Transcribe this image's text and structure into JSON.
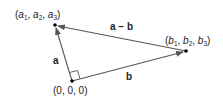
{
  "diagram": {
    "type": "vector-triangle",
    "points": {
      "origin": {
        "label": "(0, 0, 0)",
        "x": 72,
        "y": 81
      },
      "a": {
        "label_parts": [
          "(",
          "a",
          "1",
          ", ",
          "a",
          "2",
          ", ",
          "a",
          "3",
          ")"
        ],
        "x": 55,
        "y": 25
      },
      "b": {
        "label_parts": [
          "(",
          "b",
          "1",
          ", ",
          "b",
          "2",
          ", ",
          "b",
          "3",
          ")"
        ],
        "x": 186,
        "y": 51
      }
    },
    "vectors": {
      "a": {
        "label": "a",
        "from": "origin",
        "to": "a"
      },
      "b": {
        "label": "b",
        "from": "origin",
        "to": "b"
      },
      "a_minus_b": {
        "label": "a − b",
        "from": "b",
        "to": "a"
      }
    },
    "right_angle_marker": {
      "at": "origin"
    },
    "colors": {
      "line": "#555555",
      "point": "#000000",
      "text": "#222222"
    }
  }
}
